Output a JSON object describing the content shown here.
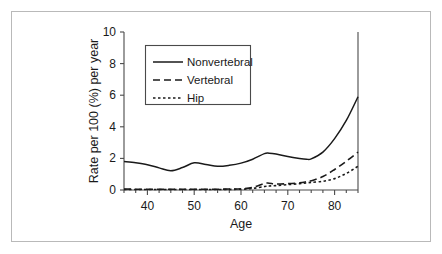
{
  "chart_data": {
    "type": "line",
    "title": "",
    "xlabel": "Age",
    "ylabel": "Rate per 100 (%) per year",
    "xlim": [
      35,
      85
    ],
    "ylim": [
      0,
      10
    ],
    "xticks": [
      40,
      50,
      60,
      70,
      80
    ],
    "yticks": [
      0,
      2,
      4,
      6,
      8,
      10
    ],
    "grid": false,
    "legend_position": "upper-left-inside",
    "x": [
      35,
      37.5,
      40,
      42.5,
      45,
      47.5,
      50,
      52.5,
      55,
      57.5,
      60,
      62.5,
      65,
      66,
      67.5,
      70,
      72.5,
      74,
      75,
      77.5,
      80,
      82.5,
      85
    ],
    "series": [
      {
        "name": "Nonvertebral",
        "style": "solid",
        "values": [
          1.8,
          1.72,
          1.6,
          1.4,
          1.22,
          1.42,
          1.72,
          1.62,
          1.5,
          1.56,
          1.7,
          1.95,
          2.3,
          2.33,
          2.28,
          2.12,
          2.0,
          1.95,
          1.97,
          2.4,
          3.25,
          4.4,
          5.9
        ]
      },
      {
        "name": "Vertebral",
        "style": "dashed",
        "values": [
          0.06,
          0.05,
          0.05,
          0.05,
          0.05,
          0.05,
          0.05,
          0.05,
          0.05,
          0.06,
          0.08,
          0.16,
          0.42,
          0.43,
          0.38,
          0.4,
          0.45,
          0.52,
          0.58,
          0.85,
          1.3,
          1.82,
          2.4
        ]
      },
      {
        "name": "Hip",
        "style": "dotted",
        "values": [
          0.03,
          0.03,
          0.03,
          0.03,
          0.03,
          0.03,
          0.03,
          0.03,
          0.03,
          0.04,
          0.05,
          0.1,
          0.22,
          0.25,
          0.28,
          0.34,
          0.4,
          0.45,
          0.48,
          0.55,
          0.72,
          1.05,
          1.5
        ]
      }
    ],
    "legend": [
      {
        "label": "Nonvertebral",
        "style": "solid"
      },
      {
        "label": "Vertebral",
        "style": "dashed"
      },
      {
        "label": "Hip",
        "style": "dotted"
      }
    ],
    "colors": {
      "line": "#1a1a1a",
      "axis": "#4a4a4a",
      "frame": "#b9b9b9",
      "background": "#ffffff"
    }
  }
}
